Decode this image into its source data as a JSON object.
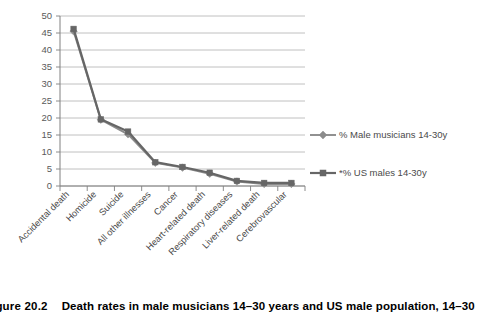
{
  "figure": {
    "caption_number": "igure 20.2",
    "caption_text": "Death rates in male musicians 14–30 years and US male population, 14–30"
  },
  "chart_data": {
    "type": "line",
    "title": "",
    "xlabel": "",
    "ylabel": "",
    "ylim": [
      0,
      50
    ],
    "ytick_step": 5,
    "grid": true,
    "legend_position": "right",
    "categories": [
      "Accidental death",
      "Homicide",
      "Suicide",
      "All other illnesses",
      "Cancer",
      "Heart-related death",
      "Respiratory diseases",
      "Liver-related death",
      "Cerebrovascular"
    ],
    "ytick_labels": [
      "0",
      "5",
      "10",
      "15",
      "20",
      "25",
      "30",
      "35",
      "40",
      "45",
      "50"
    ],
    "series": [
      {
        "name": "% Male musicians 14-30y",
        "marker": "diamond",
        "color": "#8c8c8c",
        "values": [
          45.5,
          19.5,
          15.2,
          6.8,
          5.4,
          3.6,
          1.3,
          0.6,
          0.6
        ]
      },
      {
        "name": "*% US males 14-30y",
        "marker": "square",
        "color": "#666666",
        "values": [
          46.2,
          19.6,
          16.0,
          7.0,
          5.6,
          3.9,
          1.5,
          0.9,
          0.9
        ]
      }
    ]
  },
  "legend": {
    "items": [
      {
        "label": "% Male musicians 14-30y",
        "marker": "diamond"
      },
      {
        "label": "*% US males 14-30y",
        "marker": "square"
      }
    ]
  },
  "colors": {
    "series_a": "#8c8c8c",
    "series_b": "#666666",
    "grid": "#b0b0b0",
    "axis": "#808080",
    "text": "#4a4a4a"
  }
}
